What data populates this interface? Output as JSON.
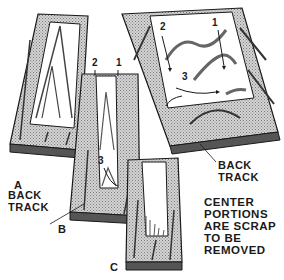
{
  "figure": {
    "labels": {
      "board_a": "A",
      "board_b": "B",
      "board_c": "C",
      "back_track_left": [
        "BACK",
        "TRACK"
      ],
      "back_track_right": [
        "BACK",
        "TRACK"
      ],
      "cut_b_1": "1",
      "cut_b_2": "2",
      "cut_b_3": "3",
      "cut_top_1": "1",
      "cut_top_2": "2",
      "cut_top_3": "3"
    },
    "note": [
      "CENTER",
      "PORTIONS",
      "ARE SCRAP",
      "TO BE",
      "REMOVED"
    ]
  },
  "colors": {
    "ink": "#1a1a1a",
    "stipple": "#b8b8b8",
    "paper": "#ffffff"
  }
}
